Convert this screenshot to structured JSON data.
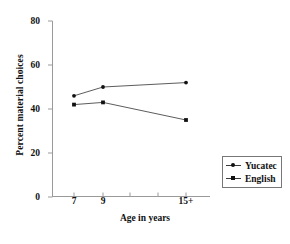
{
  "chart_data": {
    "type": "line",
    "title": "",
    "xlabel": "Age in years",
    "ylabel": "Percent material choices",
    "categories": [
      "7",
      "9",
      "15+"
    ],
    "x": [
      7,
      9,
      15
    ],
    "xtick_labels": [
      "7",
      "9",
      "15+"
    ],
    "ytick_labels": [
      "0",
      "20",
      "40",
      "60",
      "80"
    ],
    "yticks": [
      0,
      20,
      40,
      60,
      80
    ],
    "ylim": [
      0,
      80
    ],
    "xlim": [
      5.5,
      17.5
    ],
    "grid": false,
    "legend_position": "bottom-right",
    "series": [
      {
        "name": "Yucatec",
        "marker": "dot",
        "color": "#111111",
        "values": [
          46,
          50,
          52
        ]
      },
      {
        "name": "English",
        "marker": "square",
        "color": "#111111",
        "values": [
          42,
          43,
          35
        ]
      }
    ]
  },
  "axes": {
    "y_label": "Percent material choices",
    "x_label": "Age in years",
    "y_ticks": [
      "80",
      "60",
      "40",
      "20",
      "0"
    ],
    "x_ticks": [
      "7",
      "9",
      "15+"
    ]
  },
  "legend": {
    "items": [
      {
        "label": "Yucatec",
        "marker": "dot-marker"
      },
      {
        "label": "English",
        "marker": "square-marker"
      }
    ]
  }
}
